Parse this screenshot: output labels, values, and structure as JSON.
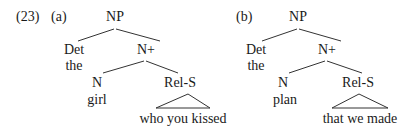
{
  "example_number": "(23)",
  "trees": [
    {
      "label": "(a)",
      "root": "NP",
      "det": {
        "category": "Det",
        "word": "the"
      },
      "nbar": "N+",
      "noun": {
        "category": "N",
        "word": "girl"
      },
      "relclause": {
        "category": "Rel-S",
        "phrase": "who you kissed"
      }
    },
    {
      "label": "(b)",
      "root": "NP",
      "det": {
        "category": "Det",
        "word": "the"
      },
      "nbar": "N+",
      "noun": {
        "category": "N",
        "word": "plan"
      },
      "relclause": {
        "category": "Rel-S",
        "phrase": "that we made"
      }
    }
  ],
  "colors": {
    "ink": "#1a1a1a",
    "lines": "#333333",
    "background": "#ffffff"
  }
}
